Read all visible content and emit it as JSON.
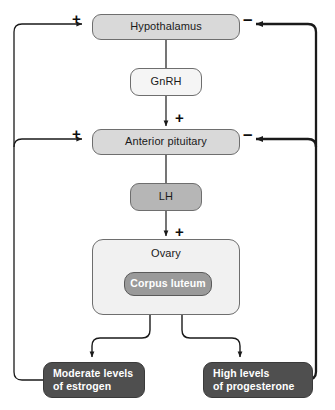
{
  "diagram": {
    "nodes": {
      "hypothalamus": "Hypothalamus",
      "gnrh": "GnRH",
      "anterior_pituitary": "Anterior pituitary",
      "lh": "LH",
      "ovary": "Ovary",
      "corpus_luteum": "Corpus luteum",
      "estrogen_line1": "Moderate levels",
      "estrogen_line2": "of estrogen",
      "progesterone_line1": "High levels",
      "progesterone_line2": "of progesterone"
    },
    "signs": {
      "hypothalamus_positive": "+",
      "hypothalamus_negative": "–",
      "pituitary_positive": "+",
      "pituitary_negative": "–",
      "gnrh_to_pituitary": "+",
      "lh_to_ovary": "+"
    },
    "colors": {
      "node_light": "#d9d9d9",
      "node_pale": "#f1f1f1",
      "node_mid": "#b6b6b6",
      "node_corpus": "#9a9a9a",
      "node_dark": "#4f4f4f",
      "line": "#1a1a1a",
      "background": "#ffffff"
    },
    "edges": [
      {
        "from": "hypothalamus",
        "to": "gnrh",
        "sign": ""
      },
      {
        "from": "gnrh",
        "to": "anterior_pituitary",
        "sign": "+"
      },
      {
        "from": "anterior_pituitary",
        "to": "lh",
        "sign": ""
      },
      {
        "from": "lh",
        "to": "ovary",
        "sign": "+"
      },
      {
        "from": "ovary",
        "to": "estrogen",
        "sign": ""
      },
      {
        "from": "ovary",
        "to": "progesterone",
        "sign": ""
      },
      {
        "from": "estrogen",
        "to": "hypothalamus",
        "sign": "+"
      },
      {
        "from": "estrogen",
        "to": "anterior_pituitary",
        "sign": "+"
      },
      {
        "from": "progesterone",
        "to": "hypothalamus",
        "sign": "–"
      },
      {
        "from": "progesterone",
        "to": "anterior_pituitary",
        "sign": "–"
      }
    ]
  }
}
